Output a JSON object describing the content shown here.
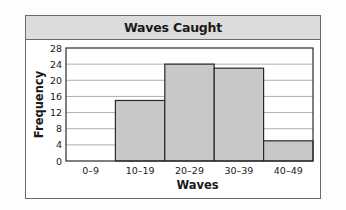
{
  "chart_data": {
    "type": "bar",
    "subtype": "histogram",
    "title": "Waves Caught",
    "xlabel": "Waves",
    "ylabel": "Frequency",
    "categories": [
      "0–9",
      "10–19",
      "20–29",
      "30–39",
      "40–49"
    ],
    "values": [
      0,
      15,
      24,
      23,
      5
    ],
    "ylim": [
      0,
      28
    ],
    "yticks": [
      0,
      4,
      8,
      12,
      16,
      20,
      24,
      28
    ],
    "grid": true,
    "legend": null,
    "colors": {
      "bar_fill": "#c8c8c8",
      "bar_stroke": "#2a2a2a",
      "grid": "#9a9a9a",
      "title_band": "#dcdcdc"
    }
  }
}
